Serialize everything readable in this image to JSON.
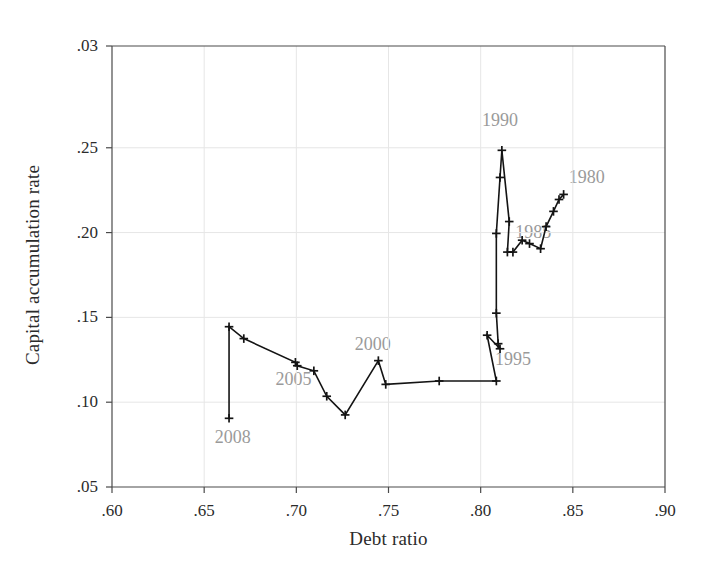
{
  "chart_data": {
    "type": "line",
    "title": "",
    "subtitle": "",
    "xlabel": "Debt ratio",
    "ylabel": "Capital accumulation rate",
    "xlim": [
      0.6,
      0.9
    ],
    "ylim": [
      0.05,
      0.31
    ],
    "grid": true,
    "legend": "none",
    "marker": "plus",
    "line_color": "#141414",
    "grid_color": "#e6e6e6",
    "annotation_color": "#9a9a9a",
    "xticks": [
      0.6,
      0.65,
      0.7,
      0.75,
      0.8,
      0.85,
      0.9
    ],
    "xtick_labels": [
      ".60",
      ".65",
      ".70",
      ".75",
      ".80",
      ".85",
      ".90"
    ],
    "yticks": [
      0.05,
      0.1,
      0.15,
      0.2,
      0.25,
      0.31
    ],
    "ytick_labels": [
      ".05",
      ".10",
      ".15",
      ".20",
      ".25",
      ".03"
    ],
    "series": [
      {
        "name": "Debt ratio vs capital accumulation rate, 1980-2008",
        "points": [
          {
            "year": 1980,
            "x": 0.845,
            "y": 0.2225
          },
          {
            "year": 1981,
            "x": 0.8425,
            "y": 0.2195
          },
          {
            "year": 1982,
            "x": 0.8395,
            "y": 0.2125
          },
          {
            "year": 1983,
            "x": 0.8355,
            "y": 0.2035
          },
          {
            "year": 1984,
            "x": 0.8325,
            "y": 0.1905
          },
          {
            "year": 1985,
            "x": 0.8265,
            "y": 0.1935
          },
          {
            "year": 1986,
            "x": 0.8225,
            "y": 0.1955
          },
          {
            "year": 1987,
            "x": 0.8175,
            "y": 0.1885
          },
          {
            "year": 1988,
            "x": 0.8145,
            "y": 0.1885
          },
          {
            "year": 1989,
            "x": 0.8155,
            "y": 0.2065
          },
          {
            "year": 1990,
            "x": 0.8115,
            "y": 0.2485
          },
          {
            "year": 1991,
            "x": 0.8105,
            "y": 0.2325
          },
          {
            "year": 1992,
            "x": 0.8085,
            "y": 0.1995
          },
          {
            "year": 1993,
            "x": 0.8085,
            "y": 0.1525
          },
          {
            "year": 1994,
            "x": 0.8095,
            "y": 0.1345
          },
          {
            "year": 1995,
            "x": 0.8105,
            "y": 0.1315
          },
          {
            "year": 1996,
            "x": 0.8035,
            "y": 0.1395
          },
          {
            "year": 1997,
            "x": 0.8085,
            "y": 0.1125
          },
          {
            "year": 1998,
            "x": 0.7775,
            "y": 0.1125
          },
          {
            "year": 1999,
            "x": 0.7485,
            "y": 0.1105
          },
          {
            "year": 2000,
            "x": 0.7445,
            "y": 0.1245
          },
          {
            "year": 2001,
            "x": 0.7265,
            "y": 0.0925
          },
          {
            "year": 2002,
            "x": 0.7165,
            "y": 0.1035
          },
          {
            "year": 2003,
            "x": 0.7095,
            "y": 0.1185
          },
          {
            "year": 2004,
            "x": 0.7005,
            "y": 0.1215
          },
          {
            "year": 2005,
            "x": 0.6995,
            "y": 0.1235
          },
          {
            "year": 2006,
            "x": 0.6715,
            "y": 0.1375
          },
          {
            "year": 2007,
            "x": 0.6635,
            "y": 0.1445
          },
          {
            "year": 2008,
            "x": 0.6635,
            "y": 0.0905
          }
        ]
      }
    ],
    "annotations": [
      {
        "label": "1990",
        "x": 0.8105,
        "y": 0.2665,
        "anchor": "above"
      },
      {
        "label": "1980",
        "x": 0.8575,
        "y": 0.2325,
        "anchor": "above-right"
      },
      {
        "label": "1985",
        "x": 0.8285,
        "y": 0.2005,
        "anchor": "center"
      },
      {
        "label": "1995",
        "x": 0.8175,
        "y": 0.1255,
        "anchor": "below-right"
      },
      {
        "label": "2000",
        "x": 0.7415,
        "y": 0.1345,
        "anchor": "above"
      },
      {
        "label": "2005",
        "x": 0.6985,
        "y": 0.1135,
        "anchor": "below"
      },
      {
        "label": "2008",
        "x": 0.6655,
        "y": 0.0795,
        "anchor": "below"
      }
    ]
  }
}
